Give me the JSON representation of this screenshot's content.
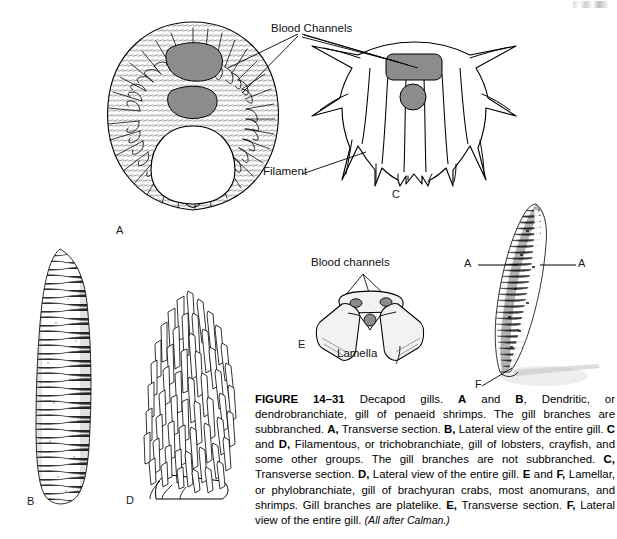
{
  "figure": {
    "number": "FIGURE 14–31",
    "caption_runs": [
      {
        "t": "FIGURE 14–31",
        "b": true
      },
      {
        "t": " Decapod gills. ",
        "b": false
      },
      {
        "t": "A",
        "b": true
      },
      {
        "t": " and ",
        "b": false
      },
      {
        "t": "B",
        "b": true
      },
      {
        "t": ", Dendritic, or dendrobranchiate, gill of penaeid shrimps. The gill branches are subbranched. ",
        "b": false
      },
      {
        "t": "A,",
        "b": true
      },
      {
        "t": " Transverse section. ",
        "b": false
      },
      {
        "t": "B,",
        "b": true
      },
      {
        "t": " Lateral view of the entire gill. ",
        "b": false
      },
      {
        "t": "C",
        "b": true
      },
      {
        "t": " and ",
        "b": false
      },
      {
        "t": "D,",
        "b": true
      },
      {
        "t": " Filamentous, or trichobranchiate, gill of lobsters, crayfish, and some other groups. The gill branches are not subbranched. ",
        "b": false
      },
      {
        "t": "C,",
        "b": true
      },
      {
        "t": " Transverse section. ",
        "b": false
      },
      {
        "t": "D,",
        "b": true
      },
      {
        "t": " Lateral view of the entire gill. ",
        "b": false
      },
      {
        "t": "E",
        "b": true
      },
      {
        "t": " and ",
        "b": false
      },
      {
        "t": "F,",
        "b": true
      },
      {
        "t": " Lamellar, or phylobranchiate, gill of brachyuran crabs, most anomurans, and shrimps. Gill branches are platelike. ",
        "b": false
      },
      {
        "t": "E,",
        "b": true
      },
      {
        "t": " Transverse section. ",
        "b": false
      },
      {
        "t": "F,",
        "b": true
      },
      {
        "t": " Lateral view of the entire gill. ",
        "b": false
      }
    ],
    "source": "(All after Calman.)"
  },
  "panels": {
    "a": {
      "letter": "A",
      "title": "Transverse section of dendrobranchiate gill",
      "label_blood_channels": "Blood Channels"
    },
    "b": {
      "letter": "B",
      "title": "Lateral view of entire dendrobranchiate gill"
    },
    "c": {
      "letter": "C",
      "title": "Transverse section of trichobranchiate gill",
      "label_filament": "Filament"
    },
    "d": {
      "letter": "D",
      "title": "Lateral view of entire trichobranchiate gill"
    },
    "e": {
      "letter": "E",
      "title": "Transverse section of phyllobranchiate gill",
      "label_blood_channels": "Blood channels",
      "label_lamella": "Lamella"
    },
    "f": {
      "letter": "F",
      "title": "Lateral view of entire phyllobranchiate gill",
      "section_mark_left": "A",
      "section_mark_right": "A"
    }
  },
  "colors": {
    "ink": "#000000",
    "blood_channel_fill": "#8c8c8c",
    "lamella_fill": "#f2f2f2",
    "paper": "#ffffff"
  }
}
